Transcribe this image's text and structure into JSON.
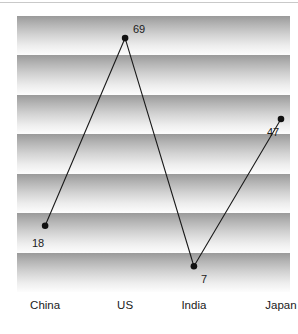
{
  "chart_data": {
    "type": "line",
    "title": "",
    "subtitle": "",
    "xlabel": "",
    "ylabel": "",
    "categories": [
      "China",
      "US",
      "India",
      "Japan"
    ],
    "values": [
      18,
      69,
      7,
      47
    ],
    "point_labels": [
      "18",
      "69",
      "7",
      "47"
    ],
    "ylim": [
      0,
      75
    ],
    "grid": "horizontal-gradient-bands",
    "band_count": 7,
    "legend": "none",
    "series": [
      {
        "name": "",
        "values": [
          18,
          69,
          7,
          47
        ]
      }
    ],
    "marker": "filled-circle",
    "line_color": "#1a1a1a",
    "marker_color": "#111111",
    "band_dark": "#9a9a9a",
    "band_light": "#fdfdfd",
    "background": "#ffffff",
    "label_color": "#1b1b1b"
  },
  "axis": {
    "categories": [
      {
        "label": "China",
        "cx_pct": 10.3
      },
      {
        "label": "US",
        "cx_pct": 39.6
      },
      {
        "label": "India",
        "cx_pct": 64.8
      },
      {
        "label": "Japan",
        "cx_pct": 96.7
      }
    ]
  },
  "points": [
    {
      "label": "18",
      "label_left": "32px",
      "label_top": "238px"
    },
    {
      "label": "69",
      "label_left": "133px",
      "label_top": "24px"
    },
    {
      "label": "7",
      "label_left": "201px",
      "label_top": "274px"
    },
    {
      "label": "47",
      "label_left": "267px",
      "label_top": "127px"
    }
  ]
}
